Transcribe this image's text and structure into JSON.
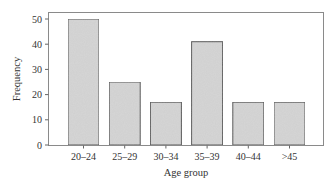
{
  "chart_data": {
    "type": "bar",
    "title": "",
    "xlabel": "Age group",
    "ylabel": "Frequency",
    "categories": [
      "20–24",
      "25–29",
      "30–34",
      "35–39",
      "40–44",
      ">45"
    ],
    "values": [
      50,
      25,
      17,
      41,
      17,
      17
    ],
    "ylim": [
      0,
      52
    ],
    "yticks": [
      0,
      10,
      20,
      30,
      40,
      50
    ],
    "grid": false,
    "legend": null,
    "bar_color": "#d4d4d4",
    "bar_edge_color": "#555555"
  },
  "labels": {
    "xlabel": "Age group",
    "ylabel": "Frequency",
    "yticks": [
      "0",
      "10",
      "20",
      "30",
      "40",
      "50"
    ],
    "categories": [
      "20–24",
      "25–29",
      "30–34",
      "35–39",
      "40–44",
      ">45"
    ]
  }
}
